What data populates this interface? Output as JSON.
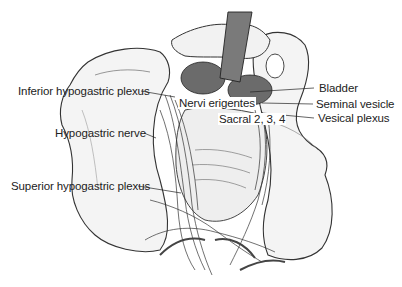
{
  "figure": {
    "type": "anatomical illustration",
    "colors": {
      "line": "#222222",
      "organ_fill": "#6b6b6b",
      "bone_fill": "#f4f4f4",
      "retractor": "#7a7a7a"
    }
  },
  "labels": {
    "left": [
      {
        "id": "inferior_hypogastric_plexus",
        "text": "Inferior hypogastric plexus"
      },
      {
        "id": "hypogastric_nerve",
        "text": "Hypogastric nerve"
      },
      {
        "id": "superior_hypogastric_plexus",
        "text": "Superior hypogastric plexus"
      }
    ],
    "center": [
      {
        "id": "nervi_erigentes",
        "text": "Nervi erigentes"
      },
      {
        "id": "sacral",
        "text": "Sacral 2, 3, 4"
      }
    ],
    "right": [
      {
        "id": "bladder",
        "text": "Bladder"
      },
      {
        "id": "seminal_vesicle",
        "text": "Seminal vesicle"
      },
      {
        "id": "vesical_plexus",
        "text": "Vesical plexus"
      }
    ]
  }
}
